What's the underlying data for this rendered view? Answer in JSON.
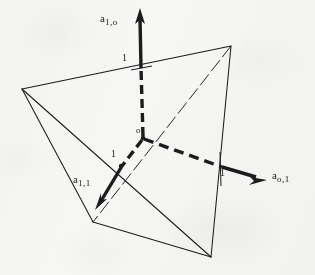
{
  "figure": {
    "background_color": "#f6f6f4",
    "ink_color": "#1c1c1c",
    "width": 315,
    "height": 275
  },
  "labels": {
    "axis_vertical": {
      "base": "a",
      "sub": "1,o"
    },
    "axis_right": {
      "base": "a",
      "sub": "o,1"
    },
    "axis_lower_left": {
      "base": "a",
      "sub": "1,1"
    },
    "origin": "o",
    "tick_vertical": "1",
    "tick_right": "1",
    "tick_lower_left": "1"
  },
  "geometry": {
    "tetrahedron_vertices": {
      "left": [
        22,
        89
      ],
      "top_right": [
        231,
        46
      ],
      "bottom_left": [
        93,
        222
      ],
      "bottom_right": [
        211,
        257
      ]
    },
    "origin_point": [
      143,
      138
    ],
    "axes": [
      {
        "name": "axis-vertical",
        "label": "a_1,o",
        "from": [
          143,
          138
        ],
        "dash_end": [
          141,
          68
        ],
        "arrow_tip": [
          140,
          9
        ],
        "tick_at": [
          141,
          68
        ],
        "tick_value": "1"
      },
      {
        "name": "axis-right",
        "label": "a_o,1",
        "from": [
          143,
          138
        ],
        "dash_end": [
          222,
          167
        ],
        "arrow_tip": [
          266,
          180
        ],
        "tick_at": [
          222,
          167
        ],
        "tick_value": "1"
      },
      {
        "name": "axis-lower-left",
        "label": "a_1,1",
        "from": [
          143,
          138
        ],
        "dash_end": [
          121,
          167
        ],
        "arrow_tip": [
          96,
          209
        ],
        "tick_at": [
          121,
          167
        ],
        "tick_value": "1"
      }
    ]
  }
}
